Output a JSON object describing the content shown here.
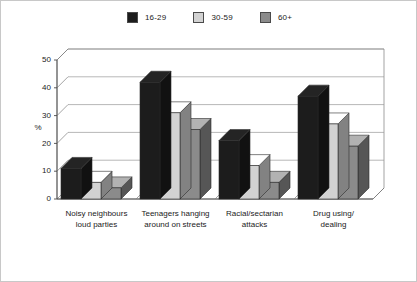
{
  "chart_data": {
    "type": "bar",
    "title": "",
    "subtitle": "",
    "xlabel": "",
    "ylabel": "%",
    "ylim": [
      0,
      50
    ],
    "yticks": [
      0,
      10,
      20,
      30,
      40,
      50
    ],
    "ytick_labels": [
      "0",
      "10",
      "20",
      "30",
      "40",
      "50"
    ],
    "grid": true,
    "grid_axis": "y",
    "legend_position": "top-center",
    "style": "3d-grouped-bars",
    "categories": [
      "Noisy neighbours loud parties",
      "Teenagers hanging around on streets",
      "Racial/sectarian attacks",
      "Drug using/ dealing"
    ],
    "category_lines": [
      [
        "Noisy neighbours",
        "loud parties"
      ],
      [
        "Teenagers hanging",
        "around on streets"
      ],
      [
        "Racial/sectarian",
        "attacks"
      ],
      [
        "Drug using/",
        "dealing"
      ]
    ],
    "series": [
      {
        "name": "16-29",
        "color": "#1c1c1c",
        "values": [
          11,
          42,
          21,
          37
        ]
      },
      {
        "name": "30-59",
        "color": "#d2d2d2",
        "values": [
          6,
          31,
          12,
          27
        ]
      },
      {
        "name": "60+",
        "color": "#8b8b8b",
        "values": [
          4,
          25,
          6,
          19
        ]
      }
    ]
  },
  "legend": {
    "entries": [
      {
        "label": "16-29",
        "color": "#1c1c1c"
      },
      {
        "label": "30-59",
        "color": "#d2d2d2"
      },
      {
        "label": "60+",
        "color": "#8b8b8b"
      }
    ]
  },
  "axes": {
    "y_title": "%",
    "y_tick_labels": [
      "0",
      "10",
      "20",
      "30",
      "40",
      "50"
    ]
  },
  "colors": {
    "series_16_29": "#1c1c1c",
    "series_30_59": "#d2d2d2",
    "series_60_plus": "#8b8b8b",
    "gridline": "#9a9a9a",
    "axis": "#4a4a4a",
    "background": "#ffffff",
    "border": "#c8c8c8"
  }
}
